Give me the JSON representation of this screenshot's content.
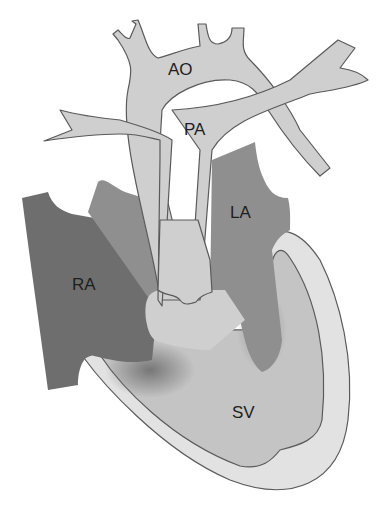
{
  "diagram": {
    "title": "",
    "type": "heart-anatomy-single-ventricle",
    "labels": {
      "aorta": "AO",
      "pulmonary_artery": "PA",
      "left_atrium": "LA",
      "right_atrium": "RA",
      "single_ventricle": "SV"
    },
    "colors": {
      "background": "#ffffff",
      "vessels": "#cfcfcf",
      "right_atrium": "#6e6e6e",
      "left_atrium": "#8f8f8f",
      "ventricle_cavity": "#c4c4c4",
      "ventricle_wall": "#e2e2e2",
      "outline": "#5a5a5a",
      "text": "#1e1e1e"
    }
  }
}
